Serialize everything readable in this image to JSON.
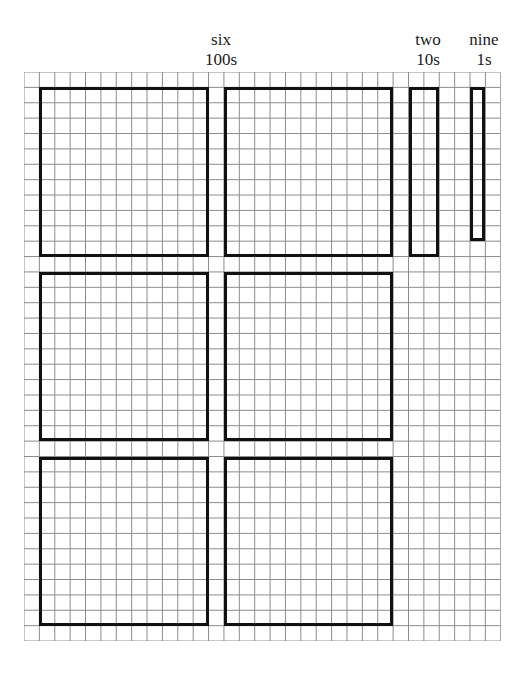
{
  "figure": {
    "kind": "place-value-grid-diagram",
    "number_represented": "629",
    "grid": {
      "columns": 31,
      "rows": 37,
      "cell_px": 15.38,
      "left_px": 24,
      "top_px": 72,
      "line_color": "#8c8c8c",
      "background": "#ffffff"
    },
    "box_color": "#111111"
  },
  "labels": [
    {
      "word": "six",
      "place": "100s",
      "x": 186,
      "y": 30,
      "width": 70
    },
    {
      "word": "two",
      "place": "10s",
      "x": 403,
      "y": 30,
      "width": 50
    },
    {
      "word": "nine",
      "place": "1s",
      "x": 458,
      "y": 30,
      "width": 52
    }
  ],
  "boxes": [
    {
      "name": "hundreds-square-1",
      "place": "100s",
      "col": 1,
      "row": 1,
      "w": 11,
      "h": 11,
      "units": 100
    },
    {
      "name": "hundreds-square-2",
      "place": "100s",
      "col": 13,
      "row": 1,
      "w": 11,
      "h": 11,
      "units": 100
    },
    {
      "name": "hundreds-square-3",
      "place": "100s",
      "col": 1,
      "row": 13,
      "w": 11,
      "h": 11,
      "units": 100
    },
    {
      "name": "hundreds-square-4",
      "place": "100s",
      "col": 13,
      "row": 13,
      "w": 11,
      "h": 11,
      "units": 100
    },
    {
      "name": "hundreds-square-5",
      "place": "100s",
      "col": 1,
      "row": 25,
      "w": 11,
      "h": 11,
      "units": 100
    },
    {
      "name": "hundreds-square-6",
      "place": "100s",
      "col": 13,
      "row": 25,
      "w": 11,
      "h": 11,
      "units": 100
    },
    {
      "name": "tens-bar-1",
      "place": "10s",
      "col": 25,
      "row": 1,
      "w": 2,
      "h": 11,
      "units": 20
    },
    {
      "name": "ones-bar-1",
      "place": "1s",
      "col": 29,
      "row": 1,
      "w": 1,
      "h": 10,
      "units": 9
    }
  ],
  "chart_data": {
    "type": "table",
    "title": "",
    "categories": [
      "100s",
      "10s",
      "1s"
    ],
    "values": [
      6,
      2,
      9
    ],
    "labels": [
      "six",
      "two",
      "nine"
    ],
    "unit_areas": [
      600,
      20,
      9
    ],
    "total": 629
  }
}
